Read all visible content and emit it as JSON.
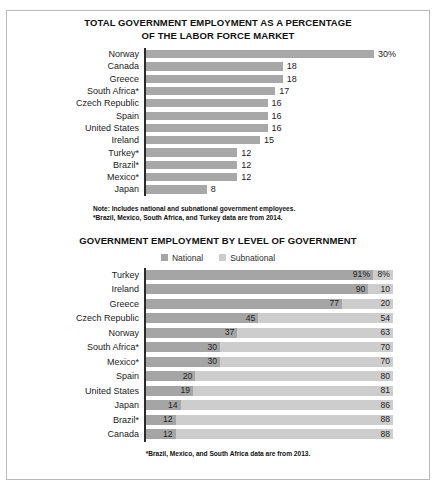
{
  "colors": {
    "national": "#a5a5a5",
    "subnational": "#cdcdcd",
    "bar": "#a8a8a8",
    "axis": "#2b2b2b",
    "frame": "#b9b9b9"
  },
  "chart_data": [
    {
      "type": "bar",
      "title": "TOTAL GOVERNMENT EMPLOYMENT AS A PERCENTAGE OF THE LABOR FORCE MARKET",
      "title_line1": "TOTAL GOVERNMENT EMPLOYMENT AS A PERCENTAGE",
      "title_line2": "OF THE LABOR FORCE MARKET",
      "xlabel": "",
      "ylabel": "",
      "xlim": [
        0,
        30
      ],
      "grid": false,
      "orientation": "horizontal",
      "categories": [
        "Norway",
        "Canada",
        "Greece",
        "South Africa*",
        "Czech Republic",
        "Spain",
        "United States",
        "Ireland",
        "Turkey*",
        "Brazil*",
        "Mexico*",
        "Japan"
      ],
      "values": [
        30,
        18,
        18,
        17,
        16,
        16,
        16,
        15,
        12,
        12,
        12,
        8
      ],
      "value_labels": [
        "30%",
        "18",
        "18",
        "17",
        "16",
        "16",
        "16",
        "15",
        "12",
        "12",
        "12",
        "8"
      ],
      "notes": [
        "Note: Includes national and subnational government employees.",
        "*Brazil, Mexico, South Africa, and Turkey data are from 2014."
      ]
    },
    {
      "type": "bar",
      "subtype": "stacked",
      "title": "GOVERNMENT EMPLOYMENT BY LEVEL OF GOVERNMENT",
      "xlabel": "",
      "ylabel": "",
      "xlim": [
        0,
        100
      ],
      "grid": false,
      "orientation": "horizontal",
      "legend_position": "top-center",
      "legend": [
        "National",
        "Subnational"
      ],
      "categories": [
        "Turkey",
        "Ireland",
        "Greece",
        "Czech Republic",
        "Norway",
        "South Africa*",
        "Mexico*",
        "Spain",
        "United States",
        "Japan",
        "Brazil*",
        "Canada"
      ],
      "series": [
        {
          "name": "National",
          "values": [
            91,
            90,
            77,
            45,
            37,
            30,
            30,
            20,
            19,
            14,
            12,
            12
          ]
        },
        {
          "name": "Subnational",
          "values": [
            8,
            10,
            20,
            54,
            63,
            70,
            70,
            80,
            81,
            86,
            88,
            88
          ]
        }
      ],
      "national_labels": [
        "91%",
        "90",
        "77",
        "45",
        "37",
        "30",
        "30",
        "20",
        "19",
        "14",
        "12",
        "12"
      ],
      "subnational_labels": [
        "8%",
        "10",
        "20",
        "54",
        "63",
        "70",
        "70",
        "80",
        "81",
        "86",
        "88",
        "88"
      ],
      "notes": [
        "*Brazil, Mexico, and South Africa data are from 2013."
      ]
    }
  ]
}
